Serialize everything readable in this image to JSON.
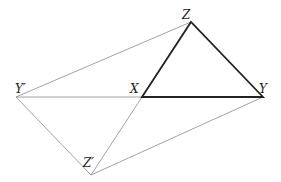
{
  "diagram": {
    "points": {
      "Z": {
        "label": "Z",
        "x": 191,
        "y": 22
      },
      "Y": {
        "label": "Y",
        "x": 263,
        "y": 97
      },
      "X": {
        "label": "X",
        "x": 142,
        "y": 97
      },
      "Yp": {
        "label": "Y′",
        "x": 16,
        "y": 97
      },
      "Zp": {
        "label": "Z′",
        "x": 91,
        "y": 175
      }
    },
    "thick_edges": [
      [
        "X",
        "Z"
      ],
      [
        "Z",
        "Y"
      ],
      [
        "X",
        "Y"
      ]
    ],
    "thin_edges": [
      [
        "Yp",
        "Z"
      ],
      [
        "Yp",
        "X"
      ],
      [
        "Yp",
        "Zp"
      ],
      [
        "Zp",
        "X"
      ],
      [
        "Zp",
        "Y"
      ]
    ],
    "colors": {
      "thick": "#222222",
      "thin": "#888888"
    }
  }
}
